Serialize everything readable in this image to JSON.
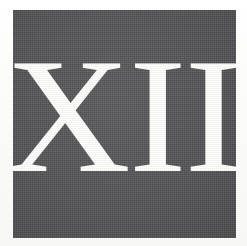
{
  "image": {
    "kind": "scanned-printed-plate",
    "description": "Large reversed-out serif Roman numeral on a dark gray printed square",
    "page_background_color": "#fbfbfa"
  },
  "plate": {
    "name": "dark-square",
    "fill_color": "#58585a",
    "texture": "halftone-dither",
    "left_px": 13,
    "top_px": 10,
    "width_px": 223,
    "height_px": 228
  },
  "numeral": {
    "text": "XII",
    "arabic_value": "12",
    "color": "#fcfcfa",
    "style": "serif-reversed-out",
    "left_px": 53,
    "top_px": 63,
    "width_px": 142,
    "height_px": 117
  }
}
